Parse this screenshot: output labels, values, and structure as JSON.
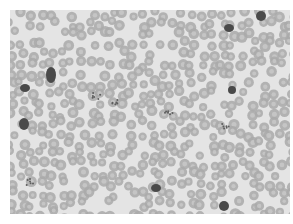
{
  "image": {
    "subject": "blood smear micrograph",
    "description": "Grayscale light-microscopy field densely packed with red blood cells, with several dark-staining white blood cells and platelet clumps",
    "background_color": "#e4e4e4",
    "rbc_color": "#a9a9a9",
    "rbc_center_color": "#c9c9c9",
    "wbc_color": "#4a4a4a",
    "platelet_color": "#5e5e5e",
    "dark_cells": [
      {
        "x": 41,
        "y": 65,
        "rx": 5,
        "ry": 8
      },
      {
        "x": 15,
        "y": 78,
        "rx": 5,
        "ry": 4
      },
      {
        "x": 14,
        "y": 114,
        "rx": 5,
        "ry": 6
      },
      {
        "x": 219,
        "y": 18,
        "rx": 5,
        "ry": 4
      },
      {
        "x": 251,
        "y": 6,
        "rx": 5,
        "ry": 5
      },
      {
        "x": 222,
        "y": 80,
        "rx": 4,
        "ry": 4
      },
      {
        "x": 146,
        "y": 178,
        "rx": 5,
        "ry": 4
      },
      {
        "x": 214,
        "y": 196,
        "rx": 5,
        "ry": 5
      }
    ],
    "platelet_clusters": [
      {
        "x": 86,
        "y": 86
      },
      {
        "x": 106,
        "y": 92
      },
      {
        "x": 160,
        "y": 104
      },
      {
        "x": 215,
        "y": 116
      },
      {
        "x": 20,
        "y": 172
      }
    ]
  }
}
